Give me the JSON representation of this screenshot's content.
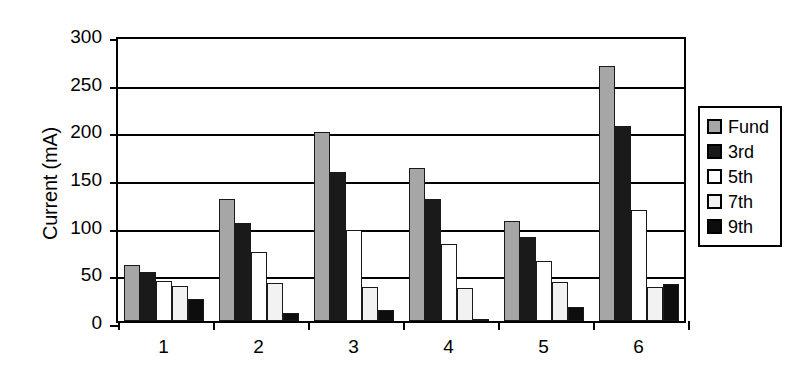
{
  "chart_data": {
    "type": "bar",
    "title": "",
    "xlabel": "",
    "ylabel": "Current (mA)",
    "categories": [
      "1",
      "2",
      "3",
      "4",
      "5",
      "6"
    ],
    "ylim": [
      0,
      300
    ],
    "yticks": [
      0,
      50,
      100,
      150,
      200,
      250,
      300
    ],
    "grid": true,
    "legend_position": "right",
    "series": [
      {
        "name": "Fund",
        "color": "#a6a6a6",
        "values": [
          59,
          128,
          198,
          161,
          105,
          267
        ]
      },
      {
        "name": "3rd",
        "color": "#1a1a1a",
        "values": [
          51,
          103,
          156,
          128,
          88,
          205
        ]
      },
      {
        "name": "5th",
        "color": "#ffffff",
        "values": [
          42,
          72,
          95,
          81,
          63,
          116
        ]
      },
      {
        "name": "7th",
        "color": "#f2f2f2",
        "values": [
          37,
          40,
          36,
          35,
          41,
          36
        ]
      },
      {
        "name": "9th",
        "color": "#0d0d0d",
        "values": [
          23,
          8,
          12,
          2,
          15,
          39
        ]
      }
    ]
  },
  "axes": {
    "y_title": "Current (mA)",
    "y_tick_labels": [
      "300",
      "250",
      "200",
      "150",
      "100",
      "50",
      "0"
    ],
    "x_tick_labels": [
      "1",
      "2",
      "3",
      "4",
      "5",
      "6"
    ]
  },
  "legend": {
    "items": [
      {
        "label": "Fund",
        "color": "#a6a6a6"
      },
      {
        "label": "3rd",
        "color": "#1a1a1a"
      },
      {
        "label": "5th",
        "color": "#ffffff"
      },
      {
        "label": "7th",
        "color": "#f2f2f2"
      },
      {
        "label": "9th",
        "color": "#0d0d0d"
      }
    ]
  },
  "colors": {
    "axis": "#000000",
    "background": "#ffffff",
    "fund": "#a6a6a6",
    "third": "#1a1a1a",
    "fifth": "#ffffff",
    "seventh": "#f2f2f2",
    "ninth": "#0d0d0d"
  }
}
